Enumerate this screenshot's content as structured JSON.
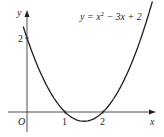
{
  "chart_data": {
    "type": "line",
    "title": "",
    "function": "y = x^2 - 3x + 2",
    "annotation": {
      "prefix": "y = x",
      "exp": "2",
      "suffix": " − 3x + 2"
    },
    "xlabel": "x",
    "ylabel": "y",
    "origin_label": "O",
    "x_ticks": [
      {
        "value": 1,
        "label": "1"
      },
      {
        "value": 2,
        "label": "2"
      }
    ],
    "y_ticks": [
      {
        "value": 2,
        "label": "2"
      }
    ],
    "xlim": [
      -0.5,
      3.4
    ],
    "ylim": [
      -0.5,
      2.7
    ],
    "grid": false,
    "legend": "none",
    "points": [
      {
        "x": -0.1,
        "y": 2.31
      },
      {
        "x": 0,
        "y": 2
      },
      {
        "x": 0.5,
        "y": 0.75
      },
      {
        "x": 1,
        "y": 0
      },
      {
        "x": 1.5,
        "y": -0.25
      },
      {
        "x": 2,
        "y": 0
      },
      {
        "x": 2.5,
        "y": 0.75
      },
      {
        "x": 3,
        "y": 2
      },
      {
        "x": 3.3,
        "y": 2.99
      }
    ],
    "roots": [
      1,
      2
    ],
    "y_intercept": 2,
    "vertex": {
      "x": 1.5,
      "y": -0.25
    },
    "colors": {
      "curve": "#231f20",
      "axes": "#231f20"
    }
  }
}
